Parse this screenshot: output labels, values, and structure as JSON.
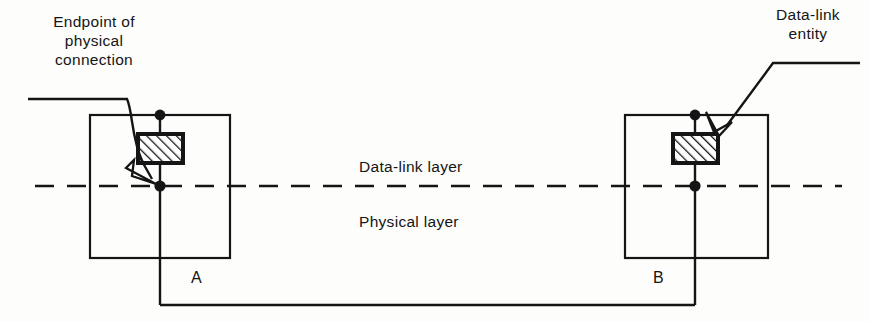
{
  "figure": {
    "type": "technical-line-diagram",
    "title_absent": true,
    "background_color": "#fdfdfb",
    "line_color": "#151515"
  },
  "callouts": {
    "endpoint": {
      "text": "Endpoint of\nphysical\nconnection",
      "lines": [
        "Endpoint of",
        "physical",
        "connection"
      ],
      "target": "lower-node-point-of-system-A",
      "leader_style": "curved-with-open-arrowhead"
    },
    "entity": {
      "text": "Data-link\nentity",
      "lines": [
        "Data-link",
        "entity"
      ],
      "target": "hatched-box-of-system-B",
      "leader_style": "straight-with-open-arrowhead"
    }
  },
  "layers": {
    "upper": "Data-link layer",
    "lower": "Physical layer",
    "divider_style": "dashed"
  },
  "systems": [
    {
      "id": "A",
      "label": "A",
      "entity_fill": "diagonal-hatch"
    },
    {
      "id": "B",
      "label": "B",
      "entity_fill": "diagonal-hatch"
    }
  ],
  "connection": {
    "name": "physical connection",
    "from": "A",
    "to": "B",
    "routing": "bottom-bus"
  }
}
